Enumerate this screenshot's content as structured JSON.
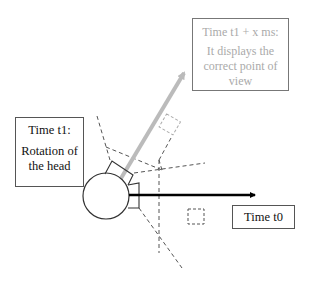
{
  "diagram": {
    "boxes": {
      "future": {
        "title": "Time t1 + x ms:",
        "body": "It displays the correct point of view",
        "color": "#aaaaaa"
      },
      "t1": {
        "title": "Time t1:",
        "body": "Rotation of the head",
        "color": "#111111"
      },
      "t0": {
        "label": "Time t0",
        "color": "#111111"
      }
    },
    "arrows": {
      "t0_direction": {
        "color": "#000000"
      },
      "t1_direction": {
        "color": "#bbbbbb"
      }
    },
    "colors": {
      "head": "#ffffff",
      "outline": "#333333",
      "dashed": "#444444",
      "faded_dashed": "#aaaaaa"
    }
  }
}
